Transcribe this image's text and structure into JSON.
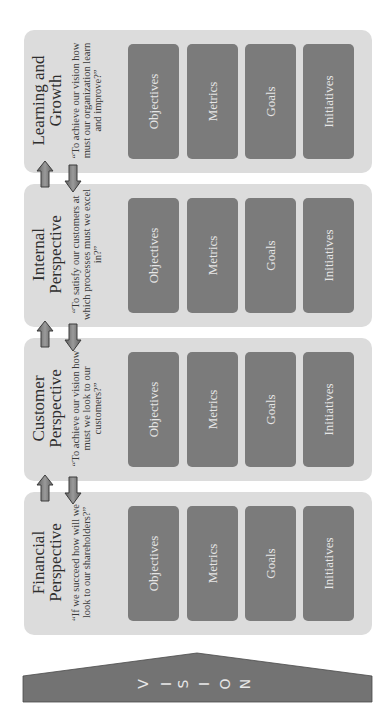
{
  "diagram": {
    "vision": {
      "label": "VISION",
      "letters": [
        "V",
        "I",
        "S",
        "I",
        "O",
        "N"
      ],
      "color": "#737373"
    },
    "colors": {
      "panel": "#dcdcdc",
      "box": "#7b7b7b",
      "box_text": "#e6e6e6",
      "arrow": "#7f7f7f"
    },
    "perspectives": [
      {
        "title": "Learning and Growth",
        "title_lines": [
          "Learning and",
          "Growth"
        ],
        "quote": "“To achieve our vision how must our organization learn and improve?”",
        "quote_lines": [
          "“To achieve our vision how",
          "must our organization learn",
          "and improve?”"
        ],
        "boxes": [
          "Objectives",
          "Metrics",
          "Goals",
          "Initiatives"
        ]
      },
      {
        "title": "Internal Perspective",
        "title_lines": [
          "Internal",
          "Perspective"
        ],
        "quote": "“To satisfy our customers at which processes must we excel in?”",
        "quote_lines": [
          "“To satisfy our customers at",
          "which processes must we excel",
          "in?”"
        ],
        "boxes": [
          "Objectives",
          "Metrics",
          "Goals",
          "Initiatives"
        ]
      },
      {
        "title": "Customer Perspective",
        "title_lines": [
          "Customer",
          "Perspective"
        ],
        "quote": "“To achieve our vision how must we look to our customers?”",
        "quote_lines": [
          "“To achieve our vision how",
          "must we look to our",
          "customers?”"
        ],
        "boxes": [
          "Objectives",
          "Metrics",
          "Goals",
          "Initiatives"
        ]
      },
      {
        "title": "Financial Perspective",
        "title_lines": [
          "Financial",
          "Perspective"
        ],
        "quote": "“If we succeed how will we look to our shareholders?”",
        "quote_lines": [
          "“If we succeed how will we",
          "look to our shareholders?”"
        ],
        "boxes": [
          "Objectives",
          "Metrics",
          "Goals",
          "Initiatives"
        ]
      }
    ],
    "connectors": [
      {
        "between": [
          "Learning and Growth",
          "Internal Perspective"
        ],
        "arrows": [
          "up",
          "down"
        ]
      },
      {
        "between": [
          "Internal Perspective",
          "Customer Perspective"
        ],
        "arrows": [
          "up",
          "down"
        ]
      },
      {
        "between": [
          "Customer Perspective",
          "Financial Perspective"
        ],
        "arrows": [
          "up",
          "down"
        ]
      }
    ]
  }
}
